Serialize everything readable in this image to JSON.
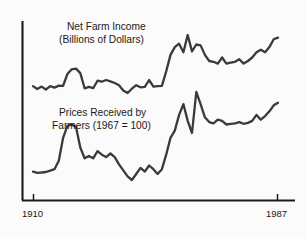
{
  "chart_data": {
    "type": "line",
    "title": "",
    "subtitle": "",
    "xlabel": "",
    "ylabel": "",
    "grid": false,
    "legend_position": "inline-annotation",
    "x": [
      1910,
      1987
    ],
    "xlim": [
      1910,
      1987
    ],
    "xticks": [
      1910,
      1987
    ],
    "xtick_labels": [
      "1910",
      "1987"
    ],
    "axis_style": "left-spine-and-baseline",
    "series": [
      {
        "name": "Net Farm Income (Billions of Dollars)",
        "label_line1": "Net Farm Income",
        "label_line2": "(Billions of Dollars)",
        "color": "#3a3a3a",
        "points": [
          [
            1910,
            13.5
          ],
          [
            1912,
            11.8
          ],
          [
            1914,
            13.2
          ],
          [
            1916,
            11.5
          ],
          [
            1918,
            13.4
          ],
          [
            1920,
            12.6
          ],
          [
            1922,
            13.8
          ],
          [
            1924,
            13.6
          ],
          [
            1926,
            20.5
          ],
          [
            1928,
            23.2
          ],
          [
            1930,
            23.6
          ],
          [
            1932,
            21.0
          ],
          [
            1934,
            12.2
          ],
          [
            1936,
            13.0
          ],
          [
            1938,
            12.3
          ],
          [
            1940,
            16.6
          ],
          [
            1942,
            16.0
          ],
          [
            1944,
            17.0
          ],
          [
            1946,
            16.2
          ],
          [
            1948,
            15.3
          ],
          [
            1950,
            14.0
          ],
          [
            1952,
            11.0
          ],
          [
            1954,
            9.5
          ],
          [
            1956,
            12.0
          ],
          [
            1958,
            14.0
          ],
          [
            1960,
            12.8
          ],
          [
            1962,
            13.0
          ],
          [
            1964,
            17.0
          ],
          [
            1966,
            13.2
          ],
          [
            1968,
            13.4
          ],
          [
            1970,
            13.6
          ],
          [
            1972,
            22.0
          ],
          [
            1974,
            31.5
          ],
          [
            1976,
            36.0
          ],
          [
            1978,
            38.0
          ],
          [
            1979,
            33.0
          ],
          [
            1980,
            43.0
          ],
          [
            1981,
            33.5
          ],
          [
            1982,
            37.5
          ],
          [
            1983,
            37.0
          ],
          [
            1984,
            31.5
          ],
          [
            1985,
            28.0
          ],
          [
            1986,
            27.5
          ],
          [
            1987,
            26.5
          ],
          [
            1988,
            30.0
          ],
          [
            1989,
            26.5
          ],
          [
            1990,
            27.0
          ],
          [
            1991,
            27.5
          ],
          [
            1992,
            29.0
          ],
          [
            1993,
            26.5
          ],
          [
            1994,
            28.0
          ],
          [
            1995,
            30.0
          ],
          [
            1996,
            33.0
          ],
          [
            1997,
            34.5
          ],
          [
            1998,
            33.0
          ],
          [
            1999,
            36.0
          ],
          [
            2000,
            40.5
          ],
          [
            2001,
            41.5
          ]
        ]
      },
      {
        "name": "Prices Received by Farmers (1967 = 100)",
        "label_line1": "Prices Received by",
        "label_line2": "Farmers (1967 = 100)",
        "color": "#3a3a3a",
        "points": [
          [
            1910,
            10.0
          ],
          [
            1912,
            9.5
          ],
          [
            1914,
            9.6
          ],
          [
            1916,
            9.8
          ],
          [
            1918,
            10.4
          ],
          [
            1920,
            11.0
          ],
          [
            1922,
            14.5
          ],
          [
            1924,
            24.0
          ],
          [
            1926,
            29.0
          ],
          [
            1928,
            29.5
          ],
          [
            1930,
            28.5
          ],
          [
            1932,
            20.0
          ],
          [
            1934,
            15.5
          ],
          [
            1936,
            16.5
          ],
          [
            1938,
            15.5
          ],
          [
            1940,
            18.5
          ],
          [
            1942,
            17.0
          ],
          [
            1944,
            16.0
          ],
          [
            1946,
            17.5
          ],
          [
            1948,
            16.0
          ],
          [
            1950,
            13.0
          ],
          [
            1952,
            10.5
          ],
          [
            1954,
            8.0
          ],
          [
            1956,
            6.5
          ],
          [
            1958,
            9.0
          ],
          [
            1960,
            11.5
          ],
          [
            1962,
            10.0
          ],
          [
            1964,
            12.5
          ],
          [
            1966,
            11.0
          ],
          [
            1968,
            9.0
          ],
          [
            1970,
            11.0
          ],
          [
            1972,
            17.0
          ],
          [
            1974,
            24.0
          ],
          [
            1976,
            27.0
          ],
          [
            1978,
            33.5
          ],
          [
            1979,
            38.0
          ],
          [
            1980,
            31.0
          ],
          [
            1981,
            26.0
          ],
          [
            1982,
            43.0
          ],
          [
            1983,
            38.0
          ],
          [
            1984,
            32.5
          ],
          [
            1985,
            30.5
          ],
          [
            1986,
            30.0
          ],
          [
            1987,
            31.5
          ],
          [
            1988,
            31.0
          ],
          [
            1989,
            29.5
          ],
          [
            1990,
            29.8
          ],
          [
            1991,
            30.0
          ],
          [
            1992,
            30.5
          ],
          [
            1993,
            29.8
          ],
          [
            1994,
            30.2
          ],
          [
            1995,
            31.0
          ],
          [
            1996,
            33.5
          ],
          [
            1997,
            31.5
          ],
          [
            1998,
            33.0
          ],
          [
            1999,
            35.0
          ],
          [
            2000,
            37.5
          ],
          [
            2001,
            38.5
          ]
        ]
      }
    ]
  },
  "labels": {
    "series1_line1": "Net Farm Income",
    "series1_line2": "(Billions of Dollars)",
    "series2_line1": "Prices Received by",
    "series2_line2": "Farmers (1967 = 100)",
    "xtick_start": "1910",
    "xtick_end": "1987"
  },
  "colors": {
    "line": "#3a3a3a",
    "axis": "#1a1a1a",
    "background": "#fbfbfb",
    "text": "#1a1a1a"
  }
}
